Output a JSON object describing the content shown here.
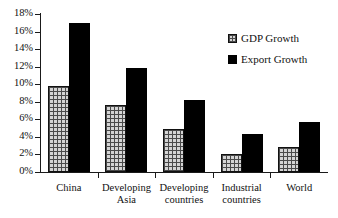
{
  "chart_data": {
    "type": "bar",
    "title": "",
    "xlabel": "",
    "ylabel": "",
    "ylim": [
      0,
      18
    ],
    "grid": false,
    "legend_position": "top-right",
    "y_tick_labels": [
      "0%",
      "2%",
      "4%",
      "6%",
      "8%",
      "10%",
      "12%",
      "14%",
      "16%",
      "18%"
    ],
    "y_tick_values": [
      0,
      2,
      4,
      6,
      8,
      10,
      12,
      14,
      16,
      18
    ],
    "categories": [
      "China",
      "Developing Asia",
      "Developing countries",
      "Industrial countries",
      "World"
    ],
    "category_label_lines": [
      [
        "China"
      ],
      [
        "Developing",
        "Asia"
      ],
      [
        "Developing",
        "countries"
      ],
      [
        "Industrial",
        "countries"
      ],
      [
        "World"
      ]
    ],
    "series": [
      {
        "name": "GDP Growth",
        "values": [
          9.8,
          7.6,
          4.9,
          2.1,
          2.8
        ],
        "swatch": "hatched"
      },
      {
        "name": "Export Growth",
        "values": [
          17.0,
          11.9,
          8.2,
          4.3,
          5.7
        ],
        "swatch": "solid-black"
      }
    ],
    "colors": {
      "gdp_fill": "#d4d4d4",
      "gdp_hatch": "#4a4a4a",
      "export_fill": "#000000",
      "axis": "#1a1a1a",
      "text": "#111111",
      "background": "#ffffff"
    }
  },
  "legend": {
    "items": [
      {
        "label": "GDP Growth"
      },
      {
        "label": "Export Growth"
      }
    ]
  }
}
